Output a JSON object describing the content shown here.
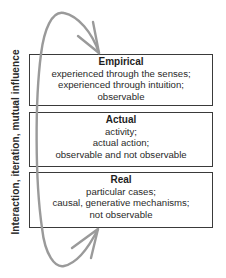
{
  "side_label": "Interaction, iteration, mutual influence",
  "levels": [
    {
      "title": "Empirical",
      "lines": [
        "experienced through the senses;",
        "experienced through intuition;",
        "observable"
      ]
    },
    {
      "title": "Actual",
      "lines": [
        "activity;",
        "actual action;",
        "observable and not observable"
      ]
    },
    {
      "title": "Real",
      "lines": [
        "particular cases;",
        "causal, generative mechanisms;",
        "not observable"
      ]
    }
  ],
  "colors": {
    "arrow": "#9a9a9a",
    "box_border": "#3a3a3a",
    "text": "#2a2a2a"
  }
}
